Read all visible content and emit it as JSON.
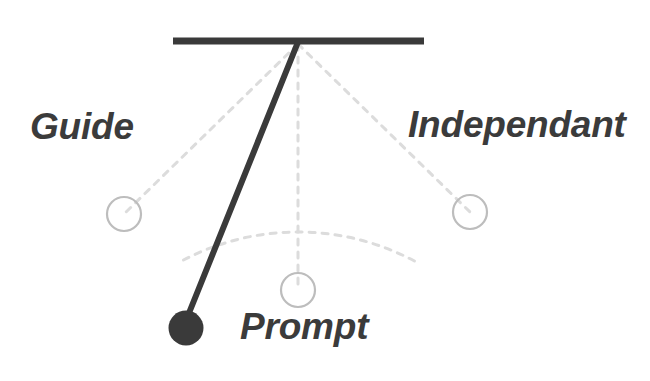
{
  "diagram": {
    "type": "pendulum-swing-diagram",
    "background_color": "#ffffff",
    "stroke_color_solid": "#3a3a3a",
    "stroke_color_dashed": "#dcdcdc",
    "circle_outline_color": "#bdbdbd",
    "bob_fill_color": "#3a3a3a",
    "label_color": "#3b3b3b",
    "support_bar": {
      "x1": 173,
      "y1": 41,
      "x2": 424,
      "y2": 41,
      "thickness": 7
    },
    "pivot": {
      "x": 298,
      "y": 42
    },
    "rod": {
      "x1": 298,
      "y1": 42,
      "x2": 187,
      "y2": 318,
      "thickness": 6
    },
    "bob": {
      "cx": 186,
      "cy": 328,
      "r": 17
    },
    "arc": {
      "description": "dashed swing arc through the three ghost positions",
      "radius": 248,
      "dash": "6 7"
    },
    "ghost_positions": [
      {
        "name": "guide",
        "cx": 124,
        "cy": 214,
        "r": 17
      },
      {
        "name": "prompt",
        "cx": 298,
        "cy": 290,
        "r": 17
      },
      {
        "name": "independant",
        "cx": 470,
        "cy": 212,
        "r": 17
      }
    ],
    "radial_lines": [
      {
        "name": "radial-to-guide",
        "x1": 298,
        "y1": 42,
        "x2": 124,
        "y2": 214
      },
      {
        "name": "radial-to-prompt",
        "x1": 298,
        "y1": 42,
        "x2": 298,
        "y2": 290
      },
      {
        "name": "radial-to-independant",
        "x1": 298,
        "y1": 42,
        "x2": 470,
        "y2": 212
      }
    ]
  },
  "labels": {
    "guide": "Guide",
    "prompt": "Prompt",
    "independant": "Independant"
  }
}
